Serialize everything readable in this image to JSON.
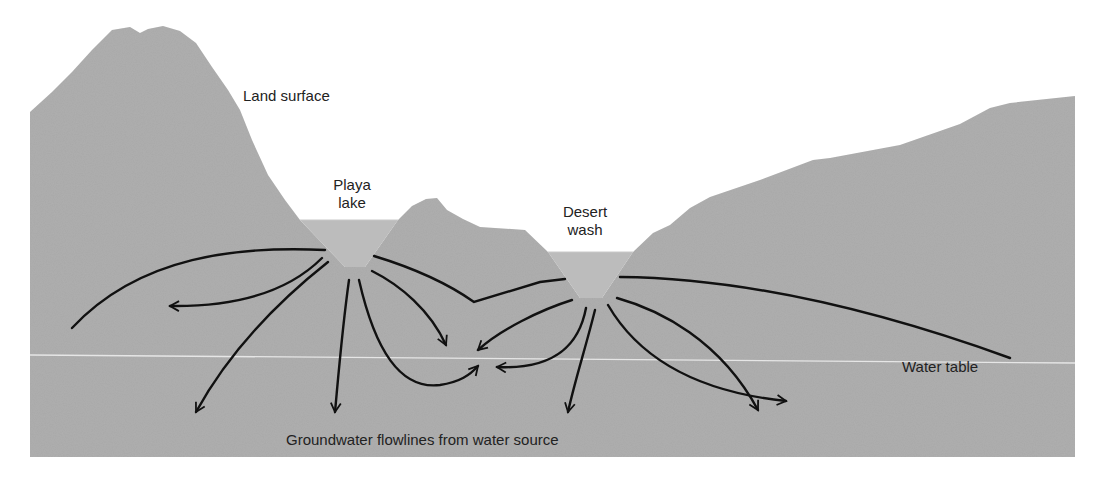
{
  "diagram": {
    "colors": {
      "ground": "#a9a9a9",
      "water": "#bcbcbc",
      "flowline": "#111111",
      "water_table_line": "#e6e6e6",
      "text": "#222222",
      "background": "#ffffff"
    },
    "labels": {
      "land_surface": "Land surface",
      "playa_line1": "Playa",
      "playa_line2": "lake",
      "desert_line1": "Desert",
      "desert_line2": "wash",
      "water_table": "Water table",
      "caption": "Groundwater flowlines from water source"
    }
  }
}
